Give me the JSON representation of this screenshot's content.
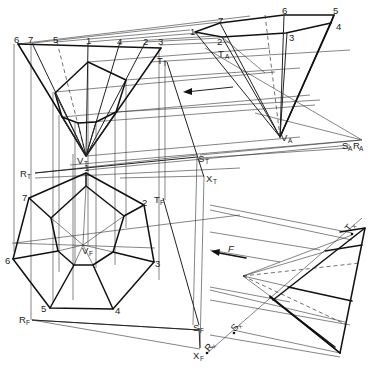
{
  "figure": {
    "views": {
      "top": {
        "base_vertex_labels": [
          "6",
          "7",
          "5",
          "1",
          "4",
          "2",
          "3"
        ],
        "apex_label": "V",
        "apex_sub": "T",
        "point_T_label": "T",
        "point_T_sub": "T",
        "point_R_label": "R",
        "point_R_sub": "T",
        "point_S_label": "S",
        "point_S_sub": "T",
        "point_X_label": "X",
        "point_X_sub": "T"
      },
      "auxiliary": {
        "base_vertex_labels": [
          "1",
          "7",
          "2",
          "6",
          "3",
          "5",
          "4"
        ],
        "apex_label": "V",
        "apex_sub": "A",
        "point_T_label": "T",
        "point_T_sub": "A",
        "point_SR_label": "S",
        "point_SR_sub1": "A",
        "point_SR_label2": "R",
        "point_SR_sub2": "A"
      },
      "front": {
        "base_vertex_labels": [
          "1",
          "2",
          "3",
          "4",
          "5",
          "6",
          "7"
        ],
        "apex_label": "V",
        "apex_sub": "F",
        "point_T_label": "T",
        "point_T_sub": "F",
        "point_R_label": "R",
        "point_R_sub": "F",
        "point_S_label": "S",
        "point_S_sub": "F",
        "point_X_label": "X",
        "point_X_sub": "F"
      },
      "edge": {
        "point_T_label": "T",
        "point_T_sub": "x",
        "point_S_label": "S",
        "point_S_sub": "x",
        "point_R_label": "R",
        "point_R_sub": "x",
        "direction_label": "F"
      }
    },
    "colors": {
      "ink": "#111111",
      "paper": "#ffffff"
    }
  }
}
